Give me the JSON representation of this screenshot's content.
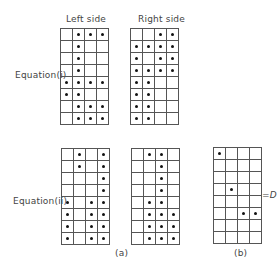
{
  "labels": {
    "left_side": "Left side",
    "right_side": "Right side",
    "equation_i": "Equation(i)",
    "equation_ii": "Equation(ii)",
    "caption_a": "(a)",
    "caption_b": "(b)",
    "equals_d": "=D"
  },
  "grids": {
    "eq_i_left": [
      [
        0,
        1,
        1,
        1
      ],
      [
        0,
        1,
        0,
        0
      ],
      [
        0,
        1,
        0,
        0
      ],
      [
        0,
        1,
        0,
        0
      ],
      [
        1,
        1,
        1,
        1
      ],
      [
        1,
        1,
        0,
        0
      ],
      [
        0,
        1,
        1,
        1
      ],
      [
        0,
        1,
        1,
        1
      ]
    ],
    "eq_i_right": [
      [
        0,
        0,
        1,
        1
      ],
      [
        1,
        1,
        1,
        1
      ],
      [
        1,
        0,
        1,
        1
      ],
      [
        1,
        1,
        1,
        1
      ],
      [
        1,
        1,
        0,
        0
      ],
      [
        1,
        1,
        0,
        0
      ],
      [
        1,
        1,
        0,
        0
      ],
      [
        1,
        1,
        0,
        0
      ]
    ],
    "eq_ii_left": [
      [
        0,
        1,
        0,
        1
      ],
      [
        0,
        1,
        0,
        1
      ],
      [
        0,
        0,
        0,
        1
      ],
      [
        0,
        0,
        0,
        1
      ],
      [
        1,
        0,
        1,
        1
      ],
      [
        1,
        0,
        1,
        1
      ],
      [
        1,
        0,
        1,
        1
      ],
      [
        1,
        0,
        1,
        1
      ]
    ],
    "eq_ii_right": [
      [
        0,
        1,
        1,
        0
      ],
      [
        0,
        0,
        1,
        0
      ],
      [
        0,
        0,
        1,
        0
      ],
      [
        0,
        0,
        1,
        0
      ],
      [
        0,
        1,
        1,
        0
      ],
      [
        0,
        1,
        1,
        1
      ],
      [
        0,
        1,
        1,
        1
      ],
      [
        0,
        1,
        1,
        1
      ]
    ],
    "b_difference": [
      [
        1,
        0,
        0,
        0
      ],
      [
        0,
        0,
        0,
        0
      ],
      [
        0,
        0,
        0,
        0
      ],
      [
        0,
        1,
        0,
        0
      ],
      [
        0,
        0,
        0,
        0
      ],
      [
        0,
        0,
        1,
        1
      ],
      [
        0,
        0,
        0,
        0
      ],
      [
        0,
        0,
        0,
        0
      ]
    ]
  }
}
